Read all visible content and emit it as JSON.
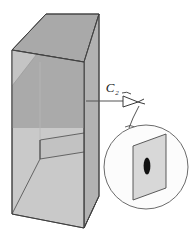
{
  "figure": {
    "name": "specimen-block-with-magnified-cross-section",
    "background_color": "#ffffff",
    "line_color": "#3a3a3a",
    "annotation": {
      "label": "C",
      "subscript": "2",
      "full_label": "C2",
      "leader_line": "horizontal line from block right face to arrowhead",
      "pointer_icon": "arrowhead-icon"
    },
    "block": {
      "name": "rectangular-specimen-block",
      "top_face_color": "#a9a9a9",
      "front_face_color": "#c9c9c9",
      "right_face_color": "#b4b4b4",
      "shadow_color": "#9b9b9b",
      "internal_plane": "horizontal interior ledge plane",
      "edge_color": "#4a4a4a"
    },
    "magnifier": {
      "name": "magnified-inset-circle",
      "circle_stroke": "#6b6b6b",
      "circle_fill": "#fbfbfb",
      "connector": "curved leader from arrowhead to circle",
      "plane": {
        "name": "cross-section-plane",
        "fill": "#d8d8d8",
        "stroke": "#4a4a4a",
        "shape": "parallelogram"
      },
      "defect": {
        "name": "elliptical-defect",
        "fill": "#111111",
        "shape": "ellipse"
      }
    }
  }
}
